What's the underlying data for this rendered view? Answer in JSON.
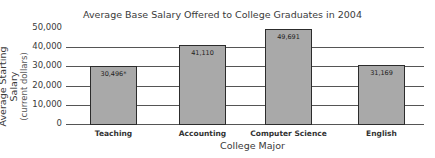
{
  "chart_data": {
    "type": "bar",
    "title": "Average Base Salary Offered to College Graduates in 2004",
    "xlabel": "College Major",
    "ylabel": "Average Starting Salary",
    "ylabel_sub": "(current dollars)",
    "categories": [
      "Teaching",
      "Accounting",
      "Computer Science",
      "English"
    ],
    "values": [
      30496,
      41110,
      49691,
      31169
    ],
    "data_labels": [
      "30,496*",
      "41,110",
      "49,691",
      "31,169"
    ],
    "yticks": [
      "0",
      "10,000",
      "20,000",
      "30,000",
      "40,000",
      "50,000"
    ],
    "ylim": [
      0,
      50000
    ],
    "grid": true,
    "legend": null,
    "bar_color": "#a9a9a9"
  }
}
